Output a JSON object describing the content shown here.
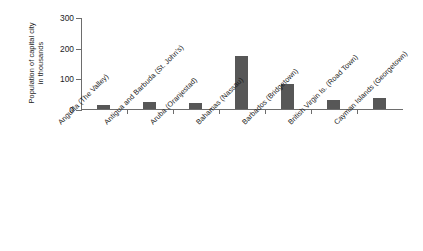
{
  "chart_data": {
    "type": "bar",
    "title": "",
    "xlabel": "",
    "ylabel": "Population of capital city in thousands",
    "ylabel_lines": [
      "Population of capital city",
      "in thousands"
    ],
    "ylim": [
      0,
      300
    ],
    "yticks": [
      0,
      100,
      200,
      300
    ],
    "ytick_labels": [
      "0",
      "100",
      "200",
      "300"
    ],
    "grid": false,
    "legend": null,
    "bar_color": "#575757",
    "axis_color": "#6d6d6d",
    "background": "#ffffff",
    "categories": [
      "Anguilla (The Valley)",
      "Antigua and Barbuda (St. John's)",
      "Aruba (Oranjestad)",
      "Bahamas (Nassau)",
      "Barbados (Bridgetown)",
      "British Virgin Is. (Road Town)",
      "Cayman Islands (Georgetown)"
    ],
    "values": [
      12,
      22,
      20,
      172,
      82,
      28,
      37
    ]
  }
}
